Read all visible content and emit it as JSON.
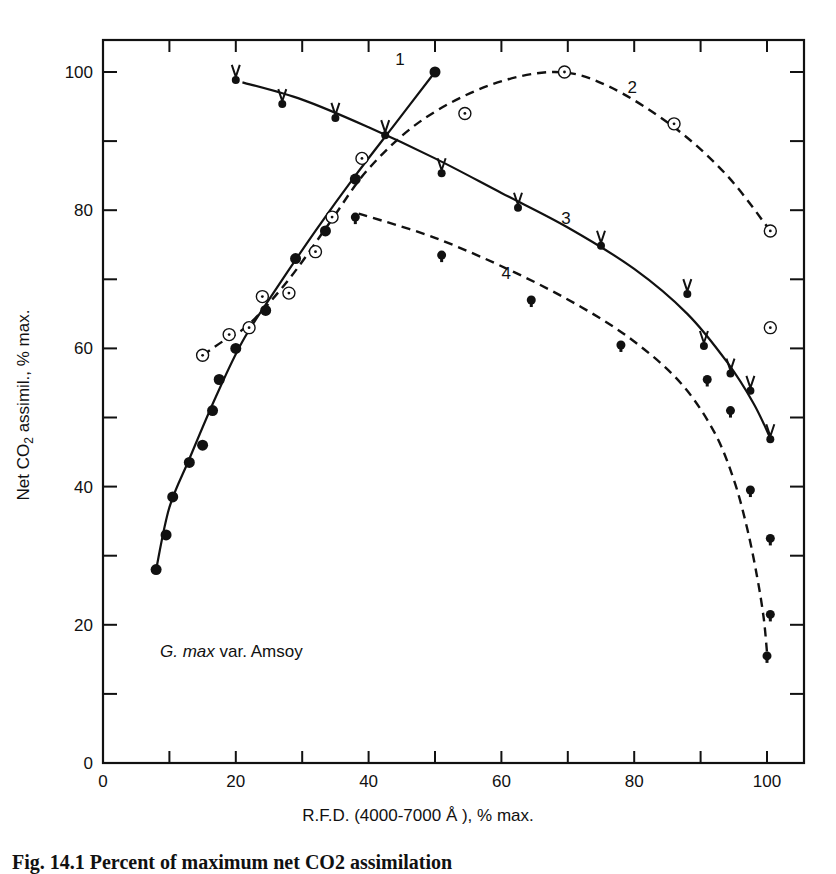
{
  "chart_data": {
    "type": "scatter",
    "title": "",
    "xlabel": "R.F.D. (4000-7000 Å ), % max.",
    "ylabel": "Net CO2 assimil., % max.",
    "xlim": [
      0,
      105
    ],
    "ylim": [
      0,
      105
    ],
    "x_ticks": [
      0,
      20,
      40,
      60,
      80,
      100
    ],
    "y_ticks": [
      0,
      20,
      40,
      60,
      80,
      100
    ],
    "grid": false,
    "annotation": "G. max var. Amsoy",
    "series": [
      {
        "name": "1",
        "marker": "filled-circle",
        "line": "solid",
        "points": [
          [
            8,
            28
          ],
          [
            9.5,
            33
          ],
          [
            10.5,
            38.5
          ],
          [
            13,
            43.5
          ],
          [
            15,
            46
          ],
          [
            16.5,
            51
          ],
          [
            17.5,
            55.5
          ],
          [
            20,
            60
          ],
          [
            24.5,
            65.5
          ],
          [
            29,
            73
          ],
          [
            33.5,
            77
          ],
          [
            38,
            84.5
          ],
          [
            50,
            100
          ]
        ]
      },
      {
        "name": "2",
        "marker": "circled-dot",
        "line": "dashed",
        "points": [
          [
            15,
            59
          ],
          [
            19,
            62
          ],
          [
            22,
            63
          ],
          [
            24,
            67.5
          ],
          [
            28,
            68
          ],
          [
            32,
            74
          ],
          [
            34.5,
            79
          ],
          [
            39,
            87.5
          ],
          [
            54.5,
            94
          ],
          [
            69.5,
            100
          ],
          [
            86,
            92.5
          ],
          [
            100.5,
            77
          ],
          [
            100.5,
            63
          ]
        ]
      },
      {
        "name": "3",
        "marker": "v-dot",
        "line": "solid",
        "points": [
          [
            20,
            99
          ],
          [
            27,
            95.5
          ],
          [
            35,
            93.5
          ],
          [
            42.5,
            91
          ],
          [
            51,
            85.5
          ],
          [
            62.5,
            80.5
          ],
          [
            75,
            75
          ],
          [
            88,
            68
          ],
          [
            90.5,
            60.5
          ],
          [
            94.5,
            56.5
          ],
          [
            97.5,
            54
          ],
          [
            100.5,
            47
          ]
        ]
      },
      {
        "name": "4",
        "marker": "pin-dot",
        "line": "dashed",
        "points": [
          [
            38,
            79
          ],
          [
            51,
            73.5
          ],
          [
            64.5,
            67
          ],
          [
            78,
            60.5
          ],
          [
            91,
            55.5
          ],
          [
            94.5,
            51
          ],
          [
            97.5,
            39.5
          ],
          [
            100.5,
            32.5
          ],
          [
            100.5,
            21.5
          ],
          [
            100,
            15.5
          ]
        ]
      }
    ]
  },
  "labels": {
    "ylabel_prefix": "Net CO",
    "ylabel_sub": "2",
    "ylabel_suffix": " assimil., % max.",
    "xlabel": "R.F.D. (4000-7000 Å ), % max.",
    "species_italic": "G. max",
    "species_rest": " var. Amsoy",
    "caption": "Fig. 14.1   Percent of maximum net CO2 assimilation"
  }
}
